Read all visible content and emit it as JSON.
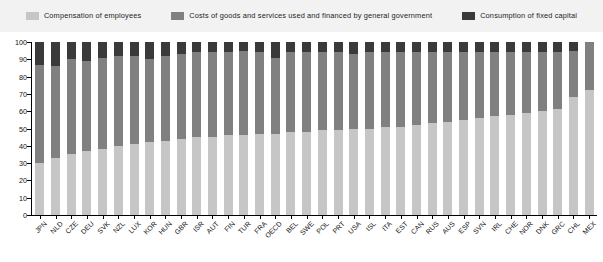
{
  "chart_data": {
    "type": "bar",
    "stacked": true,
    "title": "",
    "subtitle": "",
    "xlabel": "",
    "ylabel": "",
    "ylim": [
      0,
      100
    ],
    "ytick_labels": [
      "0",
      "10",
      "20",
      "30",
      "40",
      "50",
      "60",
      "70",
      "80",
      "90",
      "100"
    ],
    "ytick_values": [
      0,
      10,
      20,
      30,
      40,
      50,
      60,
      70,
      80,
      90,
      100
    ],
    "grid": false,
    "legend_position": "top",
    "categories": [
      "JPN",
      "NLD",
      "CZE",
      "DEU",
      "SVK",
      "NZL",
      "LUX",
      "KOR",
      "HUN",
      "GBR",
      "ISR",
      "AUT",
      "FIN",
      "TUR",
      "FRA",
      "OECD",
      "BEL",
      "SWE",
      "POL",
      "PRT",
      "USA",
      "ISL",
      "ITA",
      "EST",
      "CAN",
      "RUS",
      "AUS",
      "ESP",
      "SVN",
      "IRL",
      "CHE",
      "NOR",
      "DNK",
      "GRC",
      "CHL",
      "MEX"
    ],
    "series": [
      {
        "name": "Compensation of employees",
        "color": "#c6c6c6",
        "values": [
          30,
          33,
          35,
          37,
          38,
          40,
          41,
          42,
          43,
          44,
          45,
          45,
          46,
          46,
          47,
          47,
          48,
          48,
          49,
          49,
          50,
          50,
          51,
          51,
          52,
          53,
          54,
          55,
          56,
          57,
          58,
          59,
          60,
          61,
          68,
          72
        ]
      },
      {
        "name": "Costs of goods and services used and financed by general government",
        "color": "#808080",
        "values": [
          57,
          53,
          55,
          52,
          53,
          52,
          51,
          48,
          49,
          49,
          49,
          49,
          48,
          49,
          47,
          44,
          46,
          46,
          45,
          45,
          43,
          44,
          43,
          43,
          42,
          41,
          40,
          39,
          38,
          37,
          36,
          35,
          34,
          33,
          27,
          28
        ]
      },
      {
        "name": "Consumption of fixed capital",
        "color": "#3a3a3a",
        "values": [
          13,
          14,
          10,
          11,
          9,
          8,
          8,
          10,
          8,
          7,
          6,
          6,
          6,
          5,
          6,
          9,
          6,
          6,
          6,
          6,
          7,
          6,
          6,
          6,
          6,
          6,
          6,
          6,
          6,
          6,
          6,
          6,
          6,
          6,
          5,
          0
        ]
      }
    ]
  },
  "legend": {
    "items": [
      {
        "label": "Compensation of employees",
        "color": "#c6c6c6"
      },
      {
        "label": "Costs of goods and services used and financed by general government",
        "color": "#808080"
      },
      {
        "label": "Consumption of fixed capital",
        "color": "#3a3a3a"
      }
    ]
  }
}
